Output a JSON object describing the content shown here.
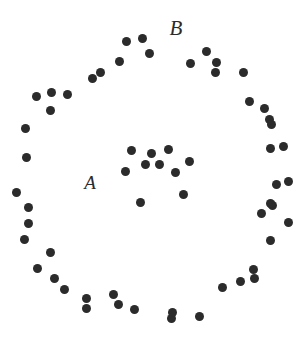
{
  "figure": {
    "width": 308,
    "height": 339,
    "background_color": "#ffffff",
    "point_color": "#2b2b2b",
    "point_diameter": 9,
    "label_color": "#2b2b2b"
  },
  "chart_data": {
    "type": "scatter",
    "title": "",
    "subtitle": "",
    "xlabel": "",
    "ylabel": "",
    "xlim": [
      0,
      308
    ],
    "ylim": [
      0,
      339
    ],
    "grid": false,
    "axes_visible": false,
    "tick_labels": [],
    "legend": {
      "visible": false,
      "position": "none",
      "entries": []
    },
    "annotations": [
      {
        "text": "A",
        "x": 90,
        "y": 182,
        "font_size": 19,
        "font_style": "italic"
      },
      {
        "text": "B",
        "x": 176,
        "y": 28,
        "font_size": 21,
        "font_style": "italic"
      }
    ],
    "series": [
      {
        "name": "A",
        "label": "A",
        "description": "inner dense cluster",
        "marker": "circle",
        "color": "#2b2b2b",
        "size": 9,
        "count": 10,
        "points": [
          {
            "x": 131,
            "y": 150
          },
          {
            "x": 168,
            "y": 149
          },
          {
            "x": 125,
            "y": 171
          },
          {
            "x": 145,
            "y": 164
          },
          {
            "x": 159,
            "y": 164
          },
          {
            "x": 189,
            "y": 161
          },
          {
            "x": 175,
            "y": 172
          },
          {
            "x": 183,
            "y": 194
          },
          {
            "x": 140,
            "y": 202
          },
          {
            "x": 151,
            "y": 153
          }
        ]
      },
      {
        "name": "B",
        "label": "B",
        "description": "outer ring cluster",
        "marker": "circle",
        "color": "#2b2b2b",
        "size": 9,
        "count": 47,
        "points": [
          {
            "x": 126,
            "y": 41
          },
          {
            "x": 142,
            "y": 38
          },
          {
            "x": 149,
            "y": 53
          },
          {
            "x": 119,
            "y": 61
          },
          {
            "x": 100,
            "y": 72
          },
          {
            "x": 92,
            "y": 78
          },
          {
            "x": 190,
            "y": 63
          },
          {
            "x": 206,
            "y": 51
          },
          {
            "x": 216,
            "y": 62
          },
          {
            "x": 215,
            "y": 72
          },
          {
            "x": 243,
            "y": 72
          },
          {
            "x": 67,
            "y": 94
          },
          {
            "x": 51,
            "y": 92
          },
          {
            "x": 36,
            "y": 96
          },
          {
            "x": 50,
            "y": 110
          },
          {
            "x": 249,
            "y": 101
          },
          {
            "x": 264,
            "y": 108
          },
          {
            "x": 269,
            "y": 119
          },
          {
            "x": 271,
            "y": 124
          },
          {
            "x": 25,
            "y": 128
          },
          {
            "x": 26,
            "y": 157
          },
          {
            "x": 270,
            "y": 148
          },
          {
            "x": 283,
            "y": 146
          },
          {
            "x": 288,
            "y": 181
          },
          {
            "x": 276,
            "y": 184
          },
          {
            "x": 16,
            "y": 192
          },
          {
            "x": 28,
            "y": 207
          },
          {
            "x": 28,
            "y": 223
          },
          {
            "x": 24,
            "y": 239
          },
          {
            "x": 272,
            "y": 205
          },
          {
            "x": 270,
            "y": 203
          },
          {
            "x": 288,
            "y": 222
          },
          {
            "x": 261,
            "y": 213
          },
          {
            "x": 270,
            "y": 240
          },
          {
            "x": 50,
            "y": 252
          },
          {
            "x": 37,
            "y": 268
          },
          {
            "x": 54,
            "y": 278
          },
          {
            "x": 64,
            "y": 289
          },
          {
            "x": 86,
            "y": 298
          },
          {
            "x": 86,
            "y": 308
          },
          {
            "x": 253,
            "y": 269
          },
          {
            "x": 254,
            "y": 278
          },
          {
            "x": 222,
            "y": 287
          },
          {
            "x": 240,
            "y": 281
          },
          {
            "x": 113,
            "y": 294
          },
          {
            "x": 118,
            "y": 304
          },
          {
            "x": 134,
            "y": 309
          },
          {
            "x": 171,
            "y": 318
          },
          {
            "x": 172,
            "y": 312
          },
          {
            "x": 199,
            "y": 316
          }
        ]
      }
    ]
  }
}
